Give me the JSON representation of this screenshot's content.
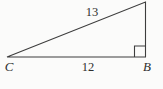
{
  "diagram": {
    "type": "right-triangle",
    "background_color": "#fbfbfa",
    "line_color": "#3d3d3d",
    "right_angle_at": "B",
    "vertex_labels": {
      "bottom_left": "C",
      "bottom_right": "B"
    },
    "side_labels": {
      "hypotenuse": "13",
      "base": "12"
    }
  }
}
